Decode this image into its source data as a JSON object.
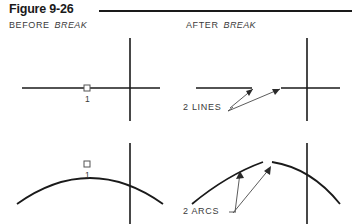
{
  "figure": {
    "title": "Figure 9-26",
    "rule_color": "#1a1a1a"
  },
  "panels": {
    "before": {
      "caption_prefix": "BEFORE",
      "caption_emphasis": "BREAK",
      "line_point_label": "1",
      "arc_point_label": "1"
    },
    "after": {
      "caption_prefix": "AFTER",
      "caption_emphasis": "BREAK",
      "lines_annotation": "2  LINES",
      "arcs_annotation": "2  ARCS"
    }
  },
  "style": {
    "geometry_color": "#1a1a1a",
    "leader_color": "#4a4a4a",
    "text_color": "#3a3a3a",
    "background": "#ffffff"
  }
}
